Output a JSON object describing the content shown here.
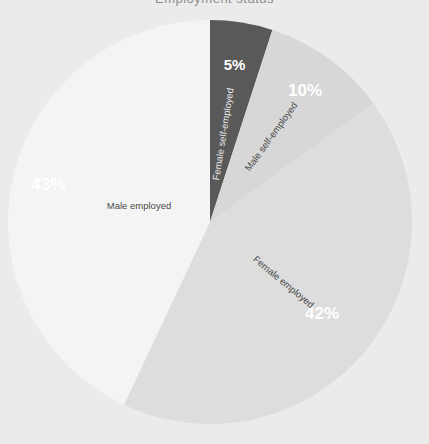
{
  "chart_data": {
    "type": "pie",
    "title": "Employment status",
    "xlabel": "",
    "ylabel": "",
    "legend_position": "none",
    "grid": false,
    "categories": [
      "Female self-employed",
      "Male self-employed",
      "Female employed",
      "Male employed"
    ],
    "values": [
      5,
      10,
      42,
      43
    ],
    "value_labels": [
      "5%",
      "10%",
      "42%",
      "43%"
    ],
    "colors": [
      "#595959",
      "#d7d7d7",
      "#dddddd",
      "#f4f4f4"
    ],
    "background": "#ebebeb",
    "slices": [
      {
        "label": "Female self-employed",
        "value": 5,
        "value_label": "5%",
        "color": "#595959",
        "pct_text_color": "#ffffff",
        "cat_text_color": "#e8e8e8"
      },
      {
        "label": "Male self-employed",
        "value": 10,
        "value_label": "10%",
        "color": "#d7d7d7",
        "pct_text_color": "#ffffff",
        "cat_text_color": "#4a4a4a"
      },
      {
        "label": "Female employed",
        "value": 42,
        "value_label": "42%",
        "color": "#dddddd",
        "pct_text_color": "#ffffff",
        "cat_text_color": "#4a4a4a"
      },
      {
        "label": "Male employed",
        "value": 43,
        "value_label": "43%",
        "color": "#f4f4f4",
        "pct_text_color": "#ffffff",
        "cat_text_color": "#4a4a4a"
      }
    ]
  }
}
